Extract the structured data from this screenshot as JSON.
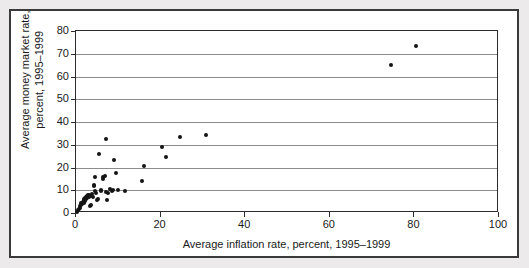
{
  "figure": {
    "background_color": "#eceaea",
    "plot_background_color": "#ffffff",
    "border_color": "#3a3a3a",
    "point_color": "#141414",
    "gridline_color": "#8c8c8c"
  },
  "chart_data": {
    "type": "scatter",
    "title": "",
    "xlabel": "Average inflation rate, percent, 1995–1999",
    "ylabel": "Average money market rate,\npercent, 1995–1999",
    "xlim": [
      0,
      100
    ],
    "ylim": [
      0,
      80
    ],
    "xticks": [
      0,
      20,
      40,
      60,
      80,
      100
    ],
    "xtick_labels": [
      "0",
      "20",
      "40",
      "60",
      "80",
      "100"
    ],
    "yticks": [
      0,
      10,
      20,
      30,
      40,
      50,
      60,
      70,
      80
    ],
    "ytick_labels": [
      "0",
      "10",
      "20",
      "30",
      "40",
      "50",
      "60",
      "70",
      "80"
    ],
    "grid": "horizontal",
    "legend": "none",
    "marker": "filled-circle",
    "points": [
      [
        0.3,
        0.6
      ],
      [
        0.5,
        1.2
      ],
      [
        0.7,
        1.8
      ],
      [
        0.9,
        2.4
      ],
      [
        1.0,
        3.0
      ],
      [
        1.2,
        3.5
      ],
      [
        1.3,
        4.2
      ],
      [
        1.5,
        4.0
      ],
      [
        1.6,
        5.0
      ],
      [
        1.8,
        4.6
      ],
      [
        1.9,
        5.6
      ],
      [
        2.0,
        6.0
      ],
      [
        2.1,
        5.2
      ],
      [
        2.2,
        6.4
      ],
      [
        2.3,
        7.0
      ],
      [
        2.4,
        6.2
      ],
      [
        2.6,
        7.4
      ],
      [
        2.7,
        6.8
      ],
      [
        2.8,
        7.8
      ],
      [
        3.0,
        7.2
      ],
      [
        3.1,
        8.0
      ],
      [
        3.3,
        7.6
      ],
      [
        3.4,
        3.0
      ],
      [
        3.6,
        3.4
      ],
      [
        3.8,
        8.2
      ],
      [
        4.0,
        7.0
      ],
      [
        4.2,
        11.8
      ],
      [
        4.3,
        12.2
      ],
      [
        4.5,
        16.0
      ],
      [
        4.6,
        9.6
      ],
      [
        4.8,
        8.6
      ],
      [
        5.0,
        5.6
      ],
      [
        5.2,
        6.0
      ],
      [
        5.5,
        26.0
      ],
      [
        5.8,
        9.8
      ],
      [
        6.0,
        10.0
      ],
      [
        6.3,
        15.0
      ],
      [
        6.5,
        15.8
      ],
      [
        6.8,
        16.2
      ],
      [
        7.0,
        32.5
      ],
      [
        7.2,
        9.2
      ],
      [
        7.4,
        5.6
      ],
      [
        7.6,
        8.8
      ],
      [
        8.0,
        10.4
      ],
      [
        8.4,
        9.8
      ],
      [
        8.8,
        10.2
      ],
      [
        9.0,
        23.5
      ],
      [
        9.5,
        17.4
      ],
      [
        10.0,
        10.0
      ],
      [
        11.5,
        9.8
      ],
      [
        15.5,
        14.0
      ],
      [
        16.0,
        20.5
      ],
      [
        20.3,
        28.8
      ],
      [
        21.2,
        24.6
      ],
      [
        24.5,
        33.5
      ],
      [
        30.8,
        34.2
      ],
      [
        74.5,
        65.0
      ],
      [
        80.3,
        73.5
      ]
    ]
  }
}
